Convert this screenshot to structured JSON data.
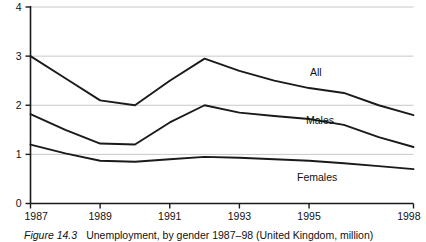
{
  "caption": {
    "figure_number": "Figure 14.3",
    "text": "Unemployment, by gender 1987–98 (United Kingdom, million)"
  },
  "chart_data": {
    "type": "line",
    "title": "Unemployment, by gender 1987–98 (United Kingdom, million)",
    "xlabel": "",
    "ylabel": "",
    "xlim": [
      1987,
      1998
    ],
    "ylim": [
      0,
      4
    ],
    "yticks": [
      0,
      1,
      2,
      3,
      4
    ],
    "ytick_labels": [
      "0",
      "1",
      "2",
      "3",
      "4"
    ],
    "xticks": [
      1987,
      1989,
      1991,
      1993,
      1995,
      1998
    ],
    "xtick_labels": [
      "1987",
      "1989",
      "1991",
      "1993",
      "1995",
      "1998"
    ],
    "grid": "horizontal",
    "grid_color": "#c8c8c8",
    "line_color": "#1a1a1a",
    "legend": "inline-labels",
    "x": [
      1987,
      1988,
      1989,
      1990,
      1991,
      1992,
      1993,
      1994,
      1995,
      1996,
      1997,
      1998
    ],
    "series": [
      {
        "name": "All",
        "label": "All",
        "values": [
          3.0,
          2.55,
          2.1,
          2.0,
          2.5,
          2.95,
          2.7,
          2.5,
          2.35,
          2.25,
          2.0,
          1.8
        ]
      },
      {
        "name": "Males",
        "label": "Males",
        "values": [
          1.82,
          1.5,
          1.22,
          1.2,
          1.65,
          2.0,
          1.85,
          1.78,
          1.72,
          1.6,
          1.35,
          1.15
        ]
      },
      {
        "name": "Females",
        "label": "Females",
        "values": [
          1.2,
          1.02,
          0.87,
          0.85,
          0.9,
          0.95,
          0.93,
          0.9,
          0.87,
          0.82,
          0.76,
          0.7
        ]
      }
    ]
  }
}
